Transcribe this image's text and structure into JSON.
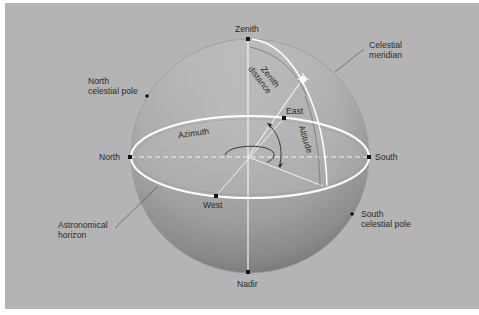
{
  "diagram": {
    "labels": {
      "zenith": "Zenith",
      "nadir": "Nadir",
      "north": "North",
      "south": "South",
      "east": "East",
      "west": "West",
      "north_pole_line1": "North",
      "north_pole_line2": "celestial pole",
      "south_pole_line1": "South",
      "south_pole_line2": "celestial pole",
      "meridian_line1": "Celestial",
      "meridian_line2": "meridian",
      "horizon_line1": "Astronomical",
      "horizon_line2": "horizon",
      "zenith_distance_line1": "Zenith",
      "zenith_distance_line2": "distance",
      "azimuth": "Azimuth",
      "altitude": "Altitude"
    },
    "colors": {
      "background": "#b4b4b4",
      "sphere_light": "#c4c4c4",
      "sphere_dark": "#8a8a8a",
      "lines": "#ffffff",
      "text": "#2a2a2a",
      "points": "#111111"
    }
  }
}
